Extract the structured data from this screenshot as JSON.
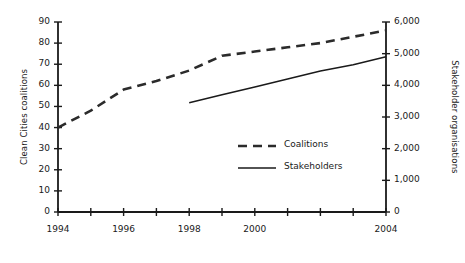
{
  "chart_data": {
    "type": "line",
    "title": "",
    "subtitle": "",
    "xlabel": "",
    "ylabel": "Clean Cities coalitions",
    "y2label": "Stakeholder organisations",
    "x": [
      1994,
      1995,
      1996,
      1997,
      1998,
      1999,
      2000,
      2001,
      2002,
      2003,
      2004
    ],
    "xlim": [
      1994,
      2004
    ],
    "xticks": [
      1994,
      1995,
      1996,
      1997,
      1998,
      1999,
      2000,
      2001,
      2002,
      2003,
      2004
    ],
    "xtick_labels": [
      "1994",
      "",
      "1996",
      "",
      "1998",
      "",
      "2000",
      "",
      "",
      "",
      "2004"
    ],
    "ylim": [
      0,
      90
    ],
    "yticks": [
      0,
      10,
      20,
      30,
      40,
      50,
      60,
      70,
      80,
      90
    ],
    "ytick_labels": [
      "0",
      "10",
      "20",
      "30",
      "40",
      "50",
      "60",
      "70",
      "80",
      "90"
    ],
    "y2lim": [
      0,
      6000
    ],
    "y2ticks": [
      0,
      1000,
      2000,
      3000,
      4000,
      5000,
      6000
    ],
    "y2tick_labels": [
      "0",
      "1,000",
      "2,000",
      "3,000",
      "4,000",
      "5,000",
      "6,000"
    ],
    "grid": false,
    "legend_position": "center-right-inside",
    "series": [
      {
        "name": "Coalitions",
        "axis": "left",
        "style": "dashed",
        "color": "#2b2b2b",
        "x": [
          1994,
          1995,
          1996,
          1997,
          1998,
          1999,
          2000,
          2001,
          2002,
          2003,
          2004
        ],
        "values": [
          40,
          48,
          58,
          62,
          67,
          74,
          76,
          78,
          80,
          83,
          86
        ]
      },
      {
        "name": "Stakeholders",
        "axis": "right",
        "style": "solid",
        "color": "#1a1a1a",
        "x": [
          1998,
          1999,
          2000,
          2001,
          2002,
          2003,
          2004
        ],
        "values": [
          3450,
          3700,
          3950,
          4200,
          4450,
          4650,
          4900
        ]
      }
    ]
  },
  "legend": {
    "items": [
      {
        "label": "Coalitions",
        "style": "dashed"
      },
      {
        "label": "Stakeholders",
        "style": "solid"
      }
    ]
  },
  "axes": {
    "left_title": "Clean Cities coalitions",
    "right_title": "Stakeholder organisations"
  }
}
